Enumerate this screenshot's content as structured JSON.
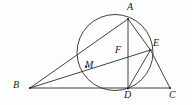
{
  "figure": {
    "background_color": "#fdfdfd",
    "stroke_color": "#2b2b2b",
    "label_color": "#1a1a1a",
    "width": 192,
    "height": 105
  },
  "circle": {
    "name": "circumscribed-circle",
    "cx": 115,
    "cy": 52.5,
    "r": 38
  },
  "points": [
    {
      "id": "A",
      "label": "A",
      "x": 128,
      "y": 19,
      "label_x": 127,
      "label_y": 2,
      "on_circle": true
    },
    {
      "id": "B",
      "label": "B",
      "x": 30,
      "y": 88,
      "label_x": 13,
      "label_y": 80,
      "on_circle": false
    },
    {
      "id": "C",
      "label": "C",
      "x": 170,
      "y": 88,
      "label_x": 169,
      "label_y": 90,
      "on_circle": false
    },
    {
      "id": "D",
      "label": "D",
      "x": 128,
      "y": 88.5,
      "label_x": 124,
      "label_y": 90,
      "on_circle": true
    },
    {
      "id": "E",
      "label": "E",
      "x": 150.5,
      "y": 50,
      "label_x": 153,
      "label_y": 38,
      "on_circle": true
    },
    {
      "id": "F",
      "label": "F",
      "x": 128,
      "y": 56,
      "label_x": 115,
      "label_y": 45,
      "on_circle": false
    },
    {
      "id": "M",
      "label": "M",
      "x": 86,
      "y": 66.5,
      "label_x": 85,
      "label_y": 60,
      "on_circle": true
    }
  ],
  "segments": [
    {
      "id": "BA",
      "name": "segment-b-a",
      "from": "B",
      "to": "A"
    },
    {
      "id": "BE",
      "name": "segment-b-e",
      "from": "B",
      "to": "E"
    },
    {
      "id": "BC",
      "name": "segment-b-c",
      "from": "B",
      "to": "C"
    },
    {
      "id": "AD",
      "name": "segment-a-d",
      "from": "A",
      "to": "D"
    },
    {
      "id": "AE",
      "name": "segment-a-e",
      "from": "A",
      "to": "E"
    },
    {
      "id": "ED",
      "name": "segment-e-d",
      "from": "E",
      "to": "D"
    },
    {
      "id": "EC",
      "name": "segment-e-c",
      "from": "E",
      "to": "C"
    }
  ]
}
